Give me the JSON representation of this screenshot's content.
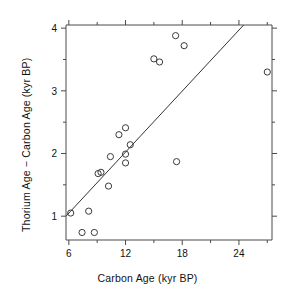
{
  "chart_data": {
    "type": "scatter",
    "title": "",
    "xlabel": "Carbon Age (kyr BP)",
    "ylabel": "Thorium Age − Carbon Age (kyr BP)",
    "xlim": [
      5.7,
      27.5
    ],
    "ylim": [
      0.62,
      4.05
    ],
    "xticks": [
      6,
      12,
      18,
      24
    ],
    "xticklabels": [
      "6",
      "12",
      "18",
      "24"
    ],
    "xminorticks": [
      9,
      15,
      21,
      27
    ],
    "yticks": [
      1,
      2,
      3,
      4
    ],
    "yticklabels": [
      "1",
      "2",
      "3",
      "4"
    ],
    "yminorticks": [
      1.5,
      2.5,
      3.5
    ],
    "grid": false,
    "legend": null,
    "marker": "open-circle",
    "points": [
      {
        "x": 6.2,
        "y": 1.05
      },
      {
        "x": 8.1,
        "y": 1.08
      },
      {
        "x": 7.4,
        "y": 0.74
      },
      {
        "x": 8.7,
        "y": 0.74
      },
      {
        "x": 9.1,
        "y": 1.68
      },
      {
        "x": 9.4,
        "y": 1.7
      },
      {
        "x": 10.2,
        "y": 1.48
      },
      {
        "x": 10.4,
        "y": 1.95
      },
      {
        "x": 11.3,
        "y": 2.3
      },
      {
        "x": 12.0,
        "y": 2.41
      },
      {
        "x": 12.0,
        "y": 1.99
      },
      {
        "x": 12.0,
        "y": 1.85
      },
      {
        "x": 12.5,
        "y": 2.14
      },
      {
        "x": 15.0,
        "y": 3.51
      },
      {
        "x": 15.6,
        "y": 3.46
      },
      {
        "x": 17.3,
        "y": 3.88
      },
      {
        "x": 18.2,
        "y": 3.72
      },
      {
        "x": 17.4,
        "y": 1.87
      },
      {
        "x": 27.0,
        "y": 3.3
      }
    ],
    "fit_line": {
      "type": "line",
      "x": [
        5.7,
        24.5
      ],
      "y": [
        1.0,
        4.05
      ]
    }
  }
}
